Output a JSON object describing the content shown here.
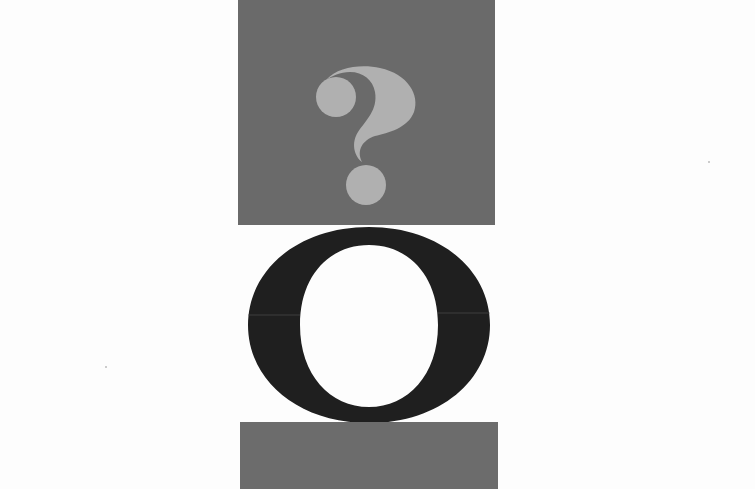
{
  "artwork": {
    "top_panel": {
      "glyph": "?",
      "color": "#6a6a6a",
      "glyph_color": "#b0b0b0"
    },
    "middle_glyph": {
      "glyph": "O",
      "color": "#1f1f1f"
    },
    "bottom_panel": {
      "color": "#6c6c6c"
    },
    "background": "#fdfdfd"
  }
}
